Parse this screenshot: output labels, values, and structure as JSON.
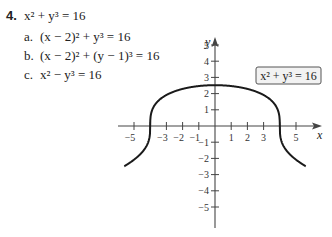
{
  "problem": {
    "number": "4.",
    "main_equation": "x² + y³ = 16",
    "parts": [
      {
        "label": "a.",
        "equation": "(x − 2)² + y³ = 16"
      },
      {
        "label": "b.",
        "equation": "(x − 2)² + (y − 1)³ = 16"
      },
      {
        "label": "c.",
        "equation": "x² − y³ = 16"
      }
    ]
  },
  "chart_data": {
    "type": "line",
    "title": "",
    "xlabel": "x",
    "ylabel": "y",
    "xlim": [
      -6,
      6
    ],
    "ylim": [
      -6,
      6
    ],
    "x_ticks": [
      -5,
      -3,
      -2,
      -1,
      1,
      2,
      3,
      5
    ],
    "x_tick_positions_all": [
      -5,
      -4,
      -3,
      -2,
      -1,
      1,
      2,
      3,
      4,
      5
    ],
    "y_ticks": [
      5,
      4,
      3,
      2,
      1,
      -1,
      -2,
      -3,
      -4,
      -5
    ],
    "grid": false,
    "legend": {
      "text": "x² + y³ = 16",
      "position": "upper right, boxed"
    },
    "series": [
      {
        "name": "x² + y³ = 16",
        "equation": "y = cbrt(16 − x²)",
        "x": [
          -5.6,
          -5,
          -4.5,
          -4.1,
          -4,
          -3.9,
          -3.5,
          -3,
          -2,
          -1,
          0,
          1,
          2,
          3,
          3.5,
          3.9,
          4,
          4.1,
          4.5,
          5,
          5.6
        ],
        "y": [
          -2.46,
          -2.08,
          -1.62,
          -0.93,
          0,
          0.93,
          1.56,
          1.91,
          2.29,
          2.47,
          2.52,
          2.47,
          2.29,
          1.91,
          1.56,
          0.93,
          0,
          -0.93,
          -1.62,
          -2.08,
          -2.46
        ]
      }
    ]
  }
}
